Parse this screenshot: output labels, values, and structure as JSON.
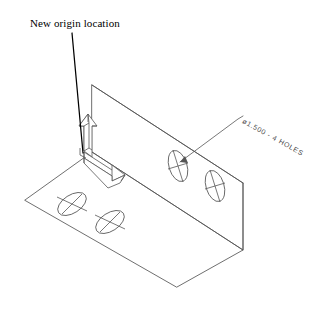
{
  "drawing": {
    "title_annotation": "New origin location",
    "hole_callout": "ø1.500 - 4 HOLES",
    "hole_diameter": "1.500",
    "hole_count": "4",
    "line_color": "#555555",
    "leader_color": "#000000",
    "text_color": "#000000",
    "dim_text_color": "#4a4a4a",
    "background_color": "#ffffff",
    "view_type": "isometric",
    "part": "L-bracket with four holes",
    "axes": [
      {
        "name": "y-axis-arrow",
        "direction": "up"
      },
      {
        "name": "x-axis-arrow",
        "direction": "right-down"
      }
    ],
    "holes": [
      {
        "name": "base-hole-left",
        "plane": "base",
        "cx": 72,
        "cy": 204
      },
      {
        "name": "base-hole-right",
        "plane": "base",
        "cx": 110,
        "cy": 222
      },
      {
        "name": "wall-hole-left",
        "plane": "wall",
        "cx": 178,
        "cy": 166
      },
      {
        "name": "wall-hole-right",
        "plane": "wall",
        "cx": 215,
        "cy": 186
      }
    ]
  }
}
